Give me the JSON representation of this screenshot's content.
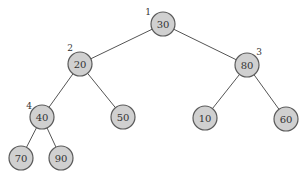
{
  "diagram": {
    "type": "binary-tree",
    "colors": {
      "node_fill": "#d0d0d0",
      "node_stroke": "#5a5a5a",
      "edge": "#555555",
      "text": "#333333"
    },
    "nodes": [
      {
        "id": "n30",
        "value": "30",
        "x": 163,
        "y": 24,
        "index": "1",
        "ix": 148,
        "iy": 12
      },
      {
        "id": "n20",
        "value": "20",
        "x": 80,
        "y": 64,
        "index": "2",
        "ix": 70,
        "iy": 48
      },
      {
        "id": "n80",
        "value": "80",
        "x": 247,
        "y": 65,
        "index": "3",
        "ix": 259,
        "iy": 52
      },
      {
        "id": "n40",
        "value": "40",
        "x": 42,
        "y": 117,
        "index": "4",
        "ix": 29,
        "iy": 106
      },
      {
        "id": "n50",
        "value": "50",
        "x": 123,
        "y": 117,
        "index": "",
        "ix": 0,
        "iy": 0
      },
      {
        "id": "n10",
        "value": "10",
        "x": 205,
        "y": 118,
        "index": "",
        "ix": 0,
        "iy": 0
      },
      {
        "id": "n60",
        "value": "60",
        "x": 286,
        "y": 119,
        "index": "",
        "ix": 0,
        "iy": 0
      },
      {
        "id": "n70",
        "value": "70",
        "x": 21,
        "y": 158,
        "index": "",
        "ix": 0,
        "iy": 0
      },
      {
        "id": "n90",
        "value": "90",
        "x": 61,
        "y": 158,
        "index": "",
        "ix": 0,
        "iy": 0
      }
    ],
    "edges": [
      [
        "n30",
        "n20"
      ],
      [
        "n30",
        "n80"
      ],
      [
        "n20",
        "n40"
      ],
      [
        "n20",
        "n50"
      ],
      [
        "n80",
        "n10"
      ],
      [
        "n80",
        "n60"
      ],
      [
        "n40",
        "n70"
      ],
      [
        "n40",
        "n90"
      ]
    ],
    "node_radius": 12
  }
}
